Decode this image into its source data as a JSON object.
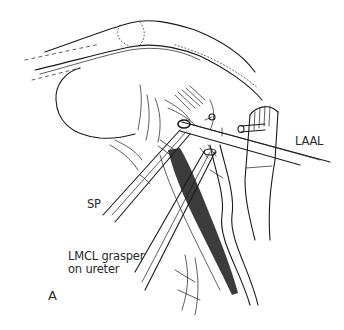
{
  "figure": {
    "panel_label": "A",
    "style": "black-and-white surgical line illustration",
    "colors": {
      "ink": "#1a1a1a",
      "background": "#ffffff",
      "label_text": "#2a2a2a"
    }
  },
  "labels": {
    "laal": "LAAL",
    "sp": "SP",
    "lmcl_line1": "LMCL grasper",
    "lmcl_line2": "on ureter"
  },
  "structures": [
    {
      "id": "abdominal-wall",
      "description": "curved body wall outline across top"
    },
    {
      "id": "organ",
      "description": "large rounded organ retracted at left"
    },
    {
      "id": "ureter",
      "description": "long tubular structure descending to bottom right"
    },
    {
      "id": "vessel-stump",
      "description": "clipped vessel with band at right"
    }
  ],
  "instruments": [
    {
      "id": "laal-instrument",
      "label_ref": "laal"
    },
    {
      "id": "sp-instrument",
      "label_ref": "sp"
    },
    {
      "id": "lmcl-grasper",
      "label_ref": "lmcl_line1"
    }
  ]
}
